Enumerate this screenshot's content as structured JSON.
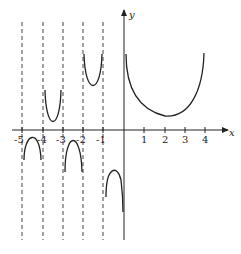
{
  "figure": {
    "type": "function-graph",
    "axes": {
      "x_label": "x",
      "y_label": "y",
      "x_ticks": [
        "-5",
        "-4",
        "-3",
        "-2",
        "-1",
        "1",
        "2",
        "3",
        "4"
      ]
    },
    "asymptotes_x": [
      -5,
      -4,
      -3,
      -2,
      -1
    ],
    "colors": {
      "curve": "#222222",
      "axis": "#222222",
      "asymptote": "#444444",
      "background": "#ffffff"
    }
  }
}
